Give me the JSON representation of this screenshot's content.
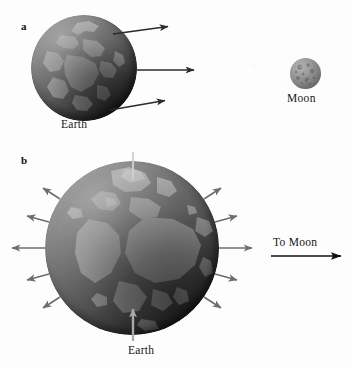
{
  "figure": {
    "background_color": "#fdfdfd",
    "width": 352,
    "height": 367
  },
  "panel_a": {
    "letter": "a",
    "earth_label": "Earth",
    "moon_label": "Moon",
    "earth": {
      "center_x": 84,
      "center_y": 68,
      "radius": 53,
      "body_color": "#7f7f7f"
    },
    "moon": {
      "center_x": 305,
      "center_y": 73,
      "radius": 15,
      "body_color": "#8c8c8c"
    },
    "arrow_color": "#2b2b2b",
    "arrows": [
      {
        "name": "upper-gravity-arrow",
        "x1": 113,
        "y1": 34,
        "x2": 170,
        "y2": 26
      },
      {
        "name": "center-gravity-arrow",
        "x1": 137,
        "y1": 70,
        "x2": 196,
        "y2": 70
      },
      {
        "name": "lower-gravity-arrow",
        "x1": 110,
        "y1": 110,
        "x2": 167,
        "y2": 100
      }
    ]
  },
  "panel_b": {
    "letter": "b",
    "earth_label": "Earth",
    "to_moon_label": "To Moon",
    "earth": {
      "center_x": 132,
      "center_y": 248,
      "radius": 87,
      "body_color": "#7f7f7f"
    },
    "tidal_arrow_color": "#6e6e6e",
    "pointer_arrow_color": "#a8a8a8",
    "to_moon_arrow_color": "#111111",
    "to_moon_arrow": {
      "x1": 272,
      "y1": 256,
      "x2": 345,
      "y2": 256
    },
    "tidal_arrows": [
      {
        "name": "tidal-arrow-left-upper-outer",
        "angle_deg": 146,
        "length": 22
      },
      {
        "name": "tidal-arrow-left-upper-inner",
        "angle_deg": 163,
        "length": 26
      },
      {
        "name": "tidal-arrow-left-equator",
        "angle_deg": 180,
        "length": 34
      },
      {
        "name": "tidal-arrow-left-lower-inner",
        "angle_deg": 197,
        "length": 26
      },
      {
        "name": "tidal-arrow-left-lower-outer",
        "angle_deg": 214,
        "length": 22
      },
      {
        "name": "tidal-arrow-right-upper-outer",
        "angle_deg": 34,
        "length": 22
      },
      {
        "name": "tidal-arrow-right-upper-inner",
        "angle_deg": 17,
        "length": 26
      },
      {
        "name": "tidal-arrow-right-equator",
        "angle_deg": 0,
        "length": 34
      },
      {
        "name": "tidal-arrow-right-lower-inner",
        "angle_deg": 343,
        "length": 26
      },
      {
        "name": "tidal-arrow-right-lower-outer",
        "angle_deg": 326,
        "length": 22
      }
    ],
    "earth_pointer_arrow": {
      "x1": 133,
      "y1": 341,
      "x2": 133,
      "y2": 307
    },
    "axis_pointer_arrow": {
      "x1": 133,
      "y1": 152,
      "x2": 133,
      "y2": 178
    }
  }
}
